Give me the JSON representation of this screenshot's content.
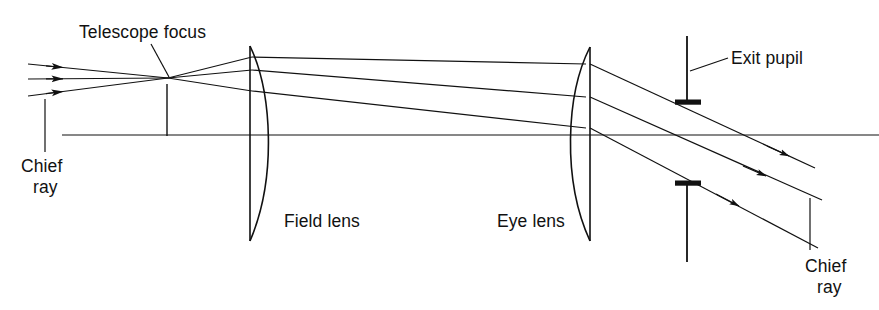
{
  "figure": {
    "background_color": "#ffffff",
    "ink_color": "#111111",
    "width": 879,
    "height": 310
  },
  "labels": {
    "telescope_focus": "Telescope focus",
    "chief_ray_left_line1": "Chief",
    "chief_ray_left_line2": "ray",
    "field_lens": "Field lens",
    "eye_lens": "Eye lens",
    "exit_pupil": "Exit pupil",
    "chief_ray_right_line1": "Chief",
    "chief_ray_right_line2": "ray"
  },
  "optics": {
    "optical_axis": {
      "y": 135,
      "x_start": 62,
      "x_end": 879
    },
    "telescope_focus_point": {
      "x": 168,
      "y": 78
    },
    "focus_tick": {
      "x": 167,
      "y_top": 84,
      "y_bottom": 135
    },
    "field_lens": {
      "x_flat": 250,
      "x_bulge": 277,
      "y_top": 46,
      "y_bottom": 241,
      "form": "plano-convex, flat left"
    },
    "eye_lens": {
      "x_flat": 590,
      "x_bulge": 566,
      "y_top": 47,
      "y_bottom": 241,
      "form": "plano-convex, flat right"
    },
    "exit_pupil_stop": {
      "bar_x_left": 675,
      "bar_x_right": 701,
      "upper_bar_y": 103,
      "lower_bar_y": 183,
      "upper_post_top": 36,
      "lower_post_bottom": 262
    },
    "incoming_rays": [
      {
        "name": "upper-ray",
        "x_start": 28,
        "y_start": 64,
        "arrow_tip_x": 62
      },
      {
        "name": "chief-ray",
        "x_start": 28,
        "y_start": 79,
        "arrow_tip_x": 62
      },
      {
        "name": "lower-ray",
        "x_start": 28,
        "y_start": 96,
        "arrow_tip_x": 62
      }
    ],
    "relay_rays": [
      {
        "name": "upper-ray",
        "x_field": 252,
        "y_field": 57,
        "x_eye": 586,
        "y_eye": 64
      },
      {
        "name": "chief-ray",
        "x_field": 252,
        "y_field": 70,
        "x_eye": 586,
        "y_eye": 97
      },
      {
        "name": "lower-ray",
        "x_field": 252,
        "y_field": 91,
        "x_eye": 586,
        "y_eye": 128
      }
    ],
    "exit_rays": [
      {
        "name": "upper-ray",
        "x_start": 590,
        "y_start": 64,
        "x_end": 815,
        "y_end": 168
      },
      {
        "name": "chief-ray",
        "x_start": 590,
        "y_start": 97,
        "x_end": 820,
        "y_end": 199
      },
      {
        "name": "lower-ray",
        "x_start": 590,
        "y_start": 128,
        "x_end": 818,
        "y_end": 248
      }
    ],
    "leaders": {
      "telescope_focus": {
        "x1": 151,
        "y1": 44,
        "x2": 169,
        "y2": 77
      },
      "chief_ray_left": {
        "x": 45,
        "y_top": 99,
        "y_bottom": 152
      },
      "exit_pupil": {
        "x1": 690,
        "y1": 71,
        "x2": 727,
        "y2": 58
      },
      "chief_ray_right": {
        "x": 810,
        "y_top": 198,
        "y_bottom": 250
      }
    },
    "label_positions": {
      "telescope_focus": {
        "x": 79,
        "y": 38
      },
      "chief_ray_left_line1": {
        "x": 21,
        "y": 172
      },
      "chief_ray_left_line2": {
        "x": 33,
        "y": 193
      },
      "field_lens": {
        "x": 284,
        "y": 227
      },
      "eye_lens": {
        "x": 497,
        "y": 227
      },
      "exit_pupil": {
        "x": 730,
        "y": 64
      },
      "chief_ray_right_line1": {
        "x": 805,
        "y": 272
      },
      "chief_ray_right_line2": {
        "x": 817,
        "y": 293
      }
    }
  }
}
